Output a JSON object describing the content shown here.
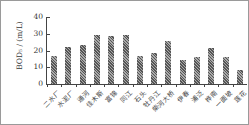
{
  "chart_data": {
    "type": "bar",
    "title": "",
    "xlabel": "",
    "ylabel": "BOD5 / (mL)",
    "ylim": [
      0,
      40
    ],
    "yticks": [
      0,
      10,
      20,
      30,
      40
    ],
    "grid": false,
    "legend": null,
    "categories": [
      "二水厂",
      "水泥厂",
      "通河",
      "佳木斯",
      "富锦",
      "同江",
      "石头",
      "牡丹江",
      "柴河大桥",
      "伊春",
      "浦泛",
      "桦南",
      "一面坡",
      "莲花"
    ],
    "values": [
      17,
      22,
      23,
      29,
      28.5,
      29.5,
      16.5,
      18.5,
      25.5,
      14.5,
      16,
      21.5,
      16,
      8.5
    ]
  },
  "axis": {
    "ylabel": "BOD₅ / (m/L)",
    "yticks": [
      "0",
      "10",
      "20",
      "30",
      "40"
    ]
  },
  "colors": {
    "bar_dark": "#555555",
    "bar_light": "#aaaaaa",
    "axis": "#444444",
    "frame": "#9a9a9a"
  }
}
